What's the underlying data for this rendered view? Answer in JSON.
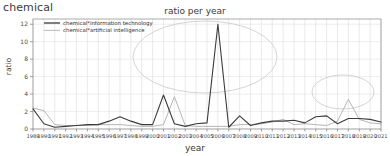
{
  "corner_label": "chemical",
  "axis": {
    "ylabel": "ratio",
    "xlabel": "year"
  },
  "legend": {
    "items": [
      {
        "label": "chemical*information technology",
        "color": "#3b3b3b"
      },
      {
        "label": "chemical*artificial intelligence",
        "color": "#a8a8a8"
      }
    ]
  },
  "annotations": [
    {
      "name": "ellipse-highlight-main",
      "cx": 205,
      "cy": 57,
      "rx": 72,
      "ry": 36,
      "color": "#c9c9c9"
    },
    {
      "name": "ellipse-highlight-secondary",
      "cx": 343,
      "cy": 92,
      "rx": 31,
      "ry": 17,
      "color": "#c9c9c9"
    }
  ],
  "chart_data": {
    "type": "line",
    "title": "ratio per year",
    "xlabel": "year",
    "ylabel": "ratio",
    "ylim": [
      0,
      12.6
    ],
    "yticks": [
      0,
      2,
      4,
      6,
      8,
      10,
      12
    ],
    "grid": true,
    "legend_position": "top-left",
    "categories": [
      "1989",
      "1990",
      "1991",
      "1992",
      "1993",
      "1994",
      "1995",
      "1996",
      "1997",
      "1998",
      "1999",
      "2000",
      "2001",
      "2002",
      "2003",
      "2004",
      "2005",
      "2006",
      "2007",
      "2008",
      "2009",
      "2010",
      "2011",
      "2012",
      "2013",
      "2014",
      "2015",
      "2016",
      "2017",
      "2018",
      "2019",
      "2020",
      "2021"
    ],
    "series": [
      {
        "name": "chemical*information technology",
        "color": "#3b3b3b",
        "values": [
          2.3,
          0.6,
          0.2,
          0.3,
          0.4,
          0.5,
          0.5,
          0.9,
          1.4,
          0.9,
          0.5,
          0.5,
          3.9,
          0.6,
          0.3,
          0.6,
          0.7,
          12.0,
          0.2,
          1.5,
          0.4,
          0.7,
          0.9,
          0.9,
          1.0,
          0.7,
          1.4,
          1.5,
          0.6,
          1.2,
          1.2,
          1.1,
          0.8
        ]
      },
      {
        "name": "chemical*artificial intelligence",
        "color": "#a8a8a8",
        "values": [
          2.4,
          2.1,
          0.5,
          0.4,
          0.4,
          0.4,
          0.5,
          0.5,
          0.5,
          0.4,
          0.3,
          0.3,
          0.5,
          3.7,
          0.4,
          0.3,
          0.3,
          0.3,
          0.3,
          0.5,
          0.5,
          0.6,
          0.8,
          1.1,
          0.5,
          0.6,
          0.5,
          0.4,
          0.9,
          3.4,
          1.1,
          0.7,
          0.6
        ]
      }
    ]
  }
}
